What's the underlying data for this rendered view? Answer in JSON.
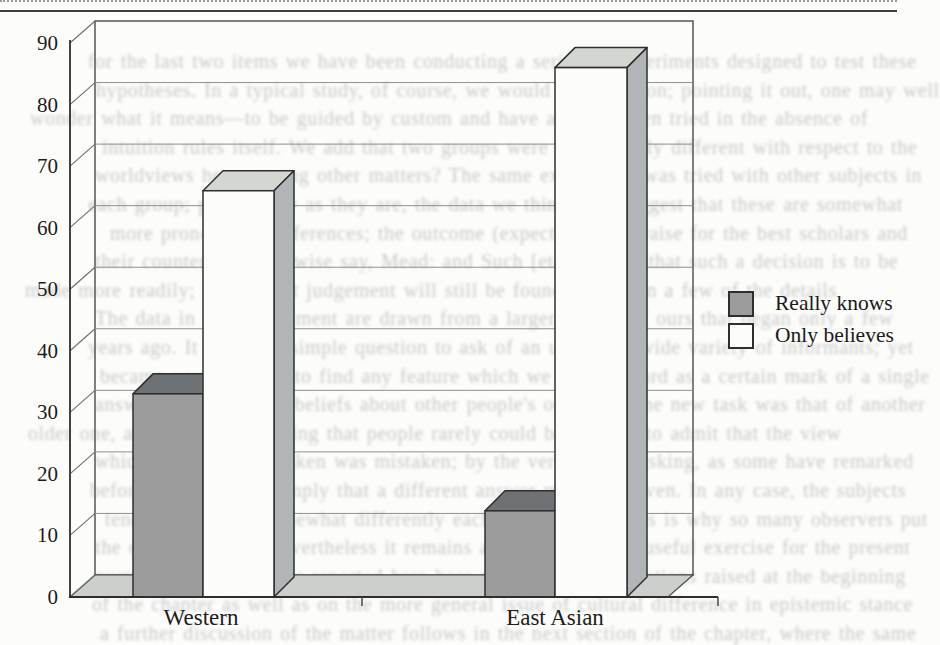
{
  "chart_data": {
    "type": "bar",
    "projection": "3d",
    "title": "",
    "xlabel": "",
    "ylabel": "",
    "categories": [
      "Western",
      "East Asian"
    ],
    "series": [
      {
        "name": "Really knows",
        "values": [
          33,
          14
        ],
        "color": "#9c9c9c"
      },
      {
        "name": "Only believes",
        "values": [
          66,
          86
        ],
        "color": "#fcfcfa"
      }
    ],
    "ylim": [
      0,
      90
    ],
    "yticks": [
      0,
      10,
      20,
      30,
      40,
      50,
      60,
      70,
      80,
      90
    ],
    "grid": true,
    "legend_position": "right-center"
  },
  "background_bleed": {
    "lines": [
      "for the last two items we have been conducting a series of experiments designed to test these",
      "hypotheses. In a typical study, of course, we would use intuition; pointing it out, one may well",
      "wonder what it means—to be guided by custom and have actually been tried in the absence of",
      "intuition rules itself. We add that two groups were significantly different with respect to the",
      "worldviews here, among other matters? The same experiment was tried with other subjects in",
      "each group; preliminary as they are, the data we think may suggest that these are somewhat",
      "more pronounced differences; the outcome (expectation of praise for the best scholars and",
      "their counterparts, likewise say, Mead: and Such [etc.] argued that such a decision is to be",
      "made more readily; the present judgement will still be found to rely on a few of the details",
      "The data in this experiment are drawn from a larger project of ours that began only a few",
      "years ago. It is a very simple question to ask of an unusually wide variety of informants; yet",
      "became very difficult to find any feature which we could regard as a certain mark of a single",
      "answer to the illusory beliefs about other people's opinions. The new task was that of another",
      "older one, and it is worth adding that people rarely could be brought to admit that the view",
      "which they had first taken was mistaken; by the very fact of asking, as some have remarked",
      "before, one seems to imply that a different answer might be given. In any case, the subjects",
      "tended to state it somewhat differently each time; perhaps this is why so many observers put",
      "the question aside. Nevertheless it remains an instructive and useful exercise for the present",
      "purpose, and the results reported here bear directly on the questions raised at the beginning",
      "of the chapter as well as on the more general issue of cultural difference in epistemic stance",
      "a further discussion of the matter follows in the next section of the chapter, where the same"
    ]
  }
}
